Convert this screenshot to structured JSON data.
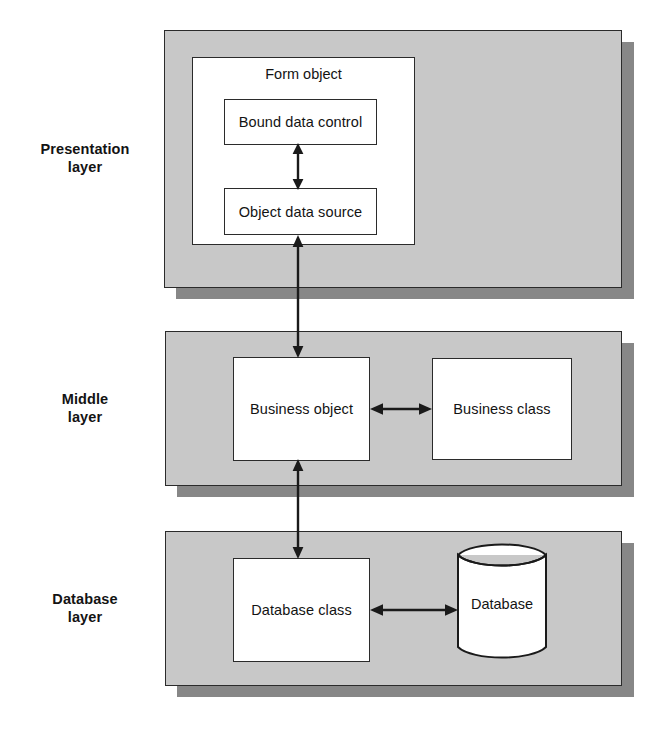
{
  "diagram": {
    "width": 671,
    "height": 735,
    "colors": {
      "panel_fill": "#c8c8c8",
      "panel_shadow": "#878787",
      "box_fill": "#ffffff",
      "stroke": "#2b2b2b",
      "text": "#131313",
      "background": "#ffffff"
    }
  },
  "layers": [
    {
      "id": "presentation",
      "label_line1": "Presentation",
      "label_line2": "layer",
      "container_label": "Form object",
      "boxes": [
        {
          "id": "bound-data-control",
          "label": "Bound data control"
        },
        {
          "id": "object-data-source",
          "label": "Object data source"
        }
      ]
    },
    {
      "id": "middle",
      "label_line1": "Middle",
      "label_line2": "layer",
      "boxes": [
        {
          "id": "business-object",
          "label": "Business object"
        },
        {
          "id": "business-class",
          "label": "Business class"
        }
      ]
    },
    {
      "id": "database",
      "label_line1": "Database",
      "label_line2": "layer",
      "boxes": [
        {
          "id": "database-class",
          "label": "Database class"
        },
        {
          "id": "database-cylinder",
          "label": "Database",
          "shape": "cylinder"
        }
      ]
    }
  ],
  "connections": [
    {
      "id": "bound-control-to-data-source",
      "from": "bound-data-control",
      "to": "object-data-source",
      "style": "double-headed",
      "orientation": "vertical"
    },
    {
      "id": "object-data-source-to-business-object",
      "from": "object-data-source",
      "to": "business-object",
      "style": "double-headed",
      "orientation": "vertical"
    },
    {
      "id": "business-object-to-business-class",
      "from": "business-object",
      "to": "business-class",
      "style": "double-headed",
      "orientation": "horizontal"
    },
    {
      "id": "business-object-to-database-class",
      "from": "business-object",
      "to": "database-class",
      "style": "double-headed",
      "orientation": "vertical"
    },
    {
      "id": "database-class-to-database",
      "from": "database-class",
      "to": "database-cylinder",
      "style": "double-headed",
      "orientation": "horizontal"
    }
  ]
}
